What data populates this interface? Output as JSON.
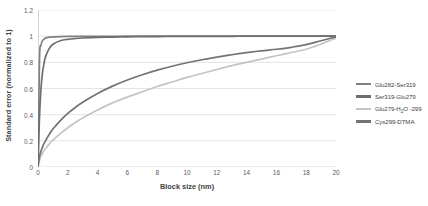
{
  "chart_data": {
    "type": "line",
    "title": "",
    "xlabel": "Block size (nm)",
    "ylabel": "Standard error (normalized to 1)",
    "xlim": [
      0,
      20
    ],
    "ylim": [
      0,
      1.2
    ],
    "xticks": [
      0,
      2,
      4,
      6,
      8,
      10,
      12,
      14,
      16,
      18,
      20
    ],
    "yticks": [
      0,
      0.2,
      0.4,
      0.6,
      0.8,
      1,
      1.2
    ],
    "ytick_labels": [
      "0",
      "0.2",
      "0.4",
      "0.6",
      "0.8",
      "1",
      "1.2"
    ],
    "xtick_labels": [
      "0",
      "2",
      "4",
      "6",
      "8",
      "10",
      "12",
      "14",
      "16",
      "18",
      "20"
    ],
    "grid": "horizontal",
    "legend_position": "right",
    "x": [
      0,
      0.1,
      0.2,
      0.3,
      0.4,
      0.5,
      0.75,
      1,
      1.5,
      2,
      2.5,
      3,
      4,
      5,
      6,
      7,
      8,
      9,
      10,
      11,
      12,
      13,
      14,
      15,
      16,
      17,
      18,
      19,
      20
    ],
    "series": [
      {
        "name": "Glu282-Ser319",
        "color": "#808080",
        "values": [
          0,
          0.82,
          0.93,
          0.965,
          0.978,
          0.985,
          0.992,
          0.995,
          0.997,
          0.998,
          0.998,
          0.999,
          0.999,
          0.999,
          1,
          1,
          1,
          1,
          1,
          1,
          1,
          1,
          1,
          1,
          1,
          1,
          1,
          1,
          1
        ]
      },
      {
        "name": "Ser319-Glu279",
        "color": "#6e6e6e",
        "values": [
          0,
          0.38,
          0.6,
          0.72,
          0.79,
          0.84,
          0.905,
          0.938,
          0.965,
          0.976,
          0.982,
          0.986,
          0.991,
          0.993,
          0.995,
          0.996,
          0.997,
          0.998,
          0.998,
          0.999,
          0.999,
          0.999,
          1,
          1,
          1,
          1,
          1,
          1,
          1
        ]
      },
      {
        "name": "Glu279-H2O-299",
        "color": "#c4c4c4",
        "values": [
          0,
          0.05,
          0.08,
          0.105,
          0.125,
          0.14,
          0.175,
          0.205,
          0.255,
          0.3,
          0.34,
          0.375,
          0.435,
          0.49,
          0.535,
          0.575,
          0.615,
          0.65,
          0.685,
          0.715,
          0.745,
          0.775,
          0.8,
          0.825,
          0.85,
          0.875,
          0.9,
          0.94,
          0.985
        ]
      },
      {
        "name": "Cys299-DTMA",
        "color": "#737373",
        "values": [
          0,
          0.08,
          0.12,
          0.152,
          0.178,
          0.2,
          0.248,
          0.29,
          0.355,
          0.41,
          0.455,
          0.495,
          0.562,
          0.618,
          0.665,
          0.705,
          0.74,
          0.77,
          0.797,
          0.82,
          0.84,
          0.858,
          0.874,
          0.888,
          0.9,
          0.915,
          0.935,
          0.965,
          0.995
        ]
      }
    ]
  },
  "legend": {
    "items": [
      {
        "label": "Glu282-Ser319",
        "label_main": "Glu282-Ser319",
        "sub": "",
        "label_tail": ""
      },
      {
        "label": "Ser319-Glu279",
        "label_main": "Ser319-Glu279",
        "sub": "",
        "label_tail": ""
      },
      {
        "label": "Glu279-H2O -299",
        "label_main": "Glu279-H",
        "sub": "2",
        "label_tail": "O -299"
      },
      {
        "label": "Cys299-DTMA",
        "label_main": "Cys299-DTMA",
        "sub": "",
        "label_tail": ""
      }
    ]
  },
  "style": {
    "grid_color": "#d9d9d9",
    "axis_color": "#a6a6a6",
    "text_color": "#3f3f3f",
    "tick_text_color": "#595959",
    "background": "#ffffff"
  }
}
